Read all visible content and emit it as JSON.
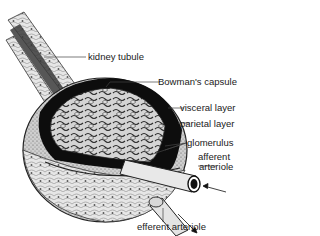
{
  "diagram": {
    "labels": {
      "kidney_tubule": "kidney tubule",
      "bowmans_capsule": "Bowman's capsule",
      "visceral_layer": "visceral layer",
      "parietal_layer": "parietal layer",
      "glomerulus": "glomerulus",
      "afferent_line1": "afferent",
      "afferent_line2": "arteriole",
      "efferent_arteriole": "efferent arteriole"
    },
    "colors": {
      "ink": "#1a1a1a",
      "cavity": "#0d0d0d",
      "tissue": "#d9d9d9",
      "tissue_light": "#eeeeee",
      "background": "#ffffff"
    }
  }
}
